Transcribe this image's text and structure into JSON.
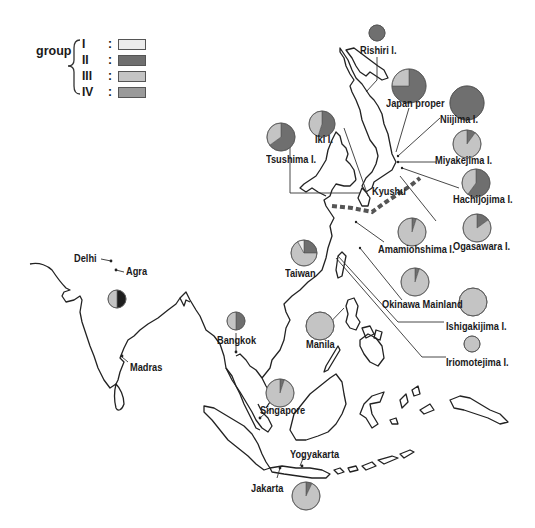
{
  "legend": {
    "title": "group",
    "groups": [
      {
        "label": "I",
        "color": "#ececec"
      },
      {
        "label": "II",
        "color": "#6f6f6f"
      },
      {
        "label": "III",
        "color": "#c4c4c4"
      },
      {
        "label": "IV",
        "color": "#9a9a9a"
      }
    ]
  },
  "locations": [
    {
      "name": "Rishiri I.",
      "pie": {
        "I": 0,
        "II": 100,
        "III": 0,
        "IV": 0
      }
    },
    {
      "name": "Japan proper",
      "pie": {
        "I": 0,
        "II": 75,
        "III": 25,
        "IV": 0
      }
    },
    {
      "name": "Niijima I.",
      "pie": {
        "I": 0,
        "II": 100,
        "III": 0,
        "IV": 0
      }
    },
    {
      "name": "Iki I.",
      "pie": {
        "I": 0,
        "II": 55,
        "III": 45,
        "IV": 0
      }
    },
    {
      "name": "Tsushima I.",
      "pie": {
        "I": 0,
        "II": 65,
        "III": 35,
        "IV": 0
      }
    },
    {
      "name": "Miyakejima I.",
      "pie": {
        "I": 0,
        "II": 10,
        "III": 90,
        "IV": 0
      }
    },
    {
      "name": "Kyushu",
      "pie": null
    },
    {
      "name": "Hachijojima I.",
      "pie": {
        "I": 0,
        "II": 60,
        "III": 40,
        "IV": 0
      }
    },
    {
      "name": "Amamiohshima I.",
      "pie": {
        "I": 0,
        "II": 5,
        "III": 95,
        "IV": 0
      }
    },
    {
      "name": "Ogasawara I.",
      "pie": {
        "I": 0,
        "II": 15,
        "III": 85,
        "IV": 0
      }
    },
    {
      "name": "Taiwan",
      "pie": {
        "I": 8,
        "II": 25,
        "III": 67,
        "IV": 0
      }
    },
    {
      "name": "Okinawa Mainland",
      "pie": {
        "I": 0,
        "II": 5,
        "III": 95,
        "IV": 0
      }
    },
    {
      "name": "Ishigakijima I.",
      "pie": {
        "I": 0,
        "II": 0,
        "III": 100,
        "IV": 0
      }
    },
    {
      "name": "Iriomotejima I.",
      "pie": {
        "I": 0,
        "II": 0,
        "III": 100,
        "IV": 0
      }
    },
    {
      "name": "Manila",
      "pie": {
        "I": 0,
        "II": 0,
        "III": 100,
        "IV": 0
      }
    },
    {
      "name": "Bangkok",
      "pie": {
        "I": 0,
        "II": 50,
        "III": 50,
        "IV": 0
      }
    },
    {
      "name": "Delhi",
      "pie": null
    },
    {
      "name": "Agra",
      "pie": {
        "I": 0,
        "II": 50,
        "III": 50,
        "IV": 0
      }
    },
    {
      "name": "Madras",
      "pie": null
    },
    {
      "name": "Singapore",
      "pie": {
        "I": 0,
        "II": 5,
        "III": 95,
        "IV": 0
      }
    },
    {
      "name": "Yogyakarta",
      "pie": null
    },
    {
      "name": "Jakarta",
      "pie": {
        "I": 0,
        "II": 7,
        "III": 93,
        "IV": 0
      }
    }
  ],
  "pie_colors": {
    "I": "#ececec",
    "II": "#6f6f6f",
    "III": "#c4c4c4",
    "IV": "#9a9a9a",
    "dark": "#1e1e1e"
  }
}
